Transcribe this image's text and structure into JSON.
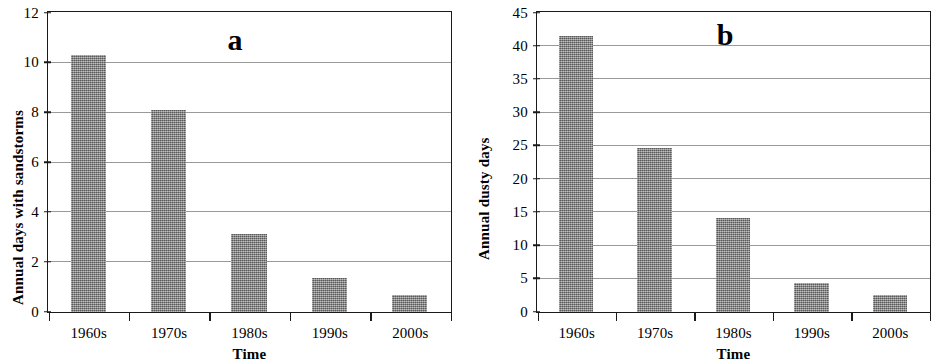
{
  "figure": {
    "width": 932,
    "height": 362,
    "background": "#ffffff",
    "bar_color": "#828282",
    "axis_color": "#1a1a1a",
    "gridline_color": "#9a9a9a"
  },
  "panels": [
    {
      "letter": "a",
      "xlabel": "Time",
      "ylabel": "Annual days with sandstorms"
    },
    {
      "letter": "b",
      "xlabel": "Time",
      "ylabel": "Annual dusty days"
    }
  ],
  "chart_data": [
    {
      "type": "bar",
      "title": "a",
      "xlabel": "Time",
      "ylabel": "Annual days with sandstorms",
      "categories": [
        "1960s",
        "1970s",
        "1980s",
        "1990s",
        "2000s"
      ],
      "values": [
        10.3,
        8.1,
        3.15,
        1.35,
        0.68
      ],
      "ylim": [
        0,
        12
      ],
      "yticks": [
        0,
        2,
        4,
        6,
        8,
        10,
        12
      ],
      "ytick_labels": [
        "0",
        "2",
        "4",
        "6",
        "8",
        "10",
        "12"
      ],
      "grid": true,
      "legend": false
    },
    {
      "type": "bar",
      "title": "b",
      "xlabel": "Time",
      "ylabel": "Annual dusty days",
      "categories": [
        "1960s",
        "1970s",
        "1980s",
        "1990s",
        "2000s"
      ],
      "values": [
        41.6,
        24.7,
        14.1,
        4.4,
        2.5
      ],
      "ylim": [
        0,
        45
      ],
      "yticks": [
        0,
        5,
        10,
        15,
        20,
        25,
        30,
        35,
        40,
        45
      ],
      "ytick_labels": [
        "0",
        "5",
        "10",
        "15",
        "20",
        "25",
        "30",
        "35",
        "40",
        "45"
      ],
      "grid": true,
      "legend": false
    }
  ]
}
